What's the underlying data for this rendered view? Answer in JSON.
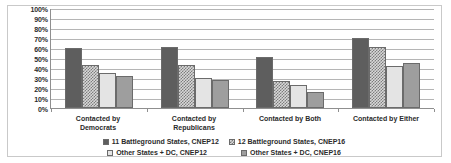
{
  "chart_data": {
    "type": "bar",
    "title": "",
    "subtitle": "",
    "xlabel": "",
    "ylabel": "",
    "ylim": [
      0,
      100
    ],
    "grid": true,
    "legend_position": "bottom",
    "categories": [
      "Contacted by Democrats",
      "Contacted by Republicans",
      "Contacted by Both",
      "Contacted by Either"
    ],
    "category_lines": [
      [
        "Contacted by",
        "Democrats"
      ],
      [
        "Contacted by",
        "Republicans"
      ],
      [
        "Contacted by Both"
      ],
      [
        "Contacted by Either"
      ]
    ],
    "y_ticks": [
      "0%",
      "10%",
      "20%",
      "30%",
      "40%",
      "50%",
      "60%",
      "70%",
      "80%",
      "90%",
      "100%"
    ],
    "y_tick_values": [
      0,
      10,
      20,
      30,
      40,
      50,
      60,
      70,
      80,
      90,
      100
    ],
    "series": [
      {
        "name": "11 Battleground States, CNEP12",
        "pattern": "solid-dark-gray",
        "color": "#5e5e5e",
        "values": [
          60,
          61,
          51,
          70
        ]
      },
      {
        "name": "12 Battleground States, CNEP16",
        "pattern": "checkerboard",
        "color": "#7d7d7d",
        "values": [
          43,
          43,
          27,
          61
        ]
      },
      {
        "name": "Other States + DC, CNEP12",
        "pattern": "light-dotted",
        "color": "#e4e4e4",
        "values": [
          35,
          30,
          23,
          42
        ]
      },
      {
        "name": "Other States + DC, CNEP16",
        "pattern": "solid-medium-gray",
        "color": "#9e9e9e",
        "values": [
          32,
          28,
          16,
          45
        ]
      }
    ]
  },
  "legend": {
    "rows": [
      [
        {
          "label": "11 Battleground States, CNEP12",
          "series": 0
        },
        {
          "label": "12 Battleground States, CNEP16",
          "series": 1
        }
      ],
      [
        {
          "label": "Other States + DC, CNEP12",
          "series": 2
        },
        {
          "label": "Other States + DC, CNEP16",
          "series": 3
        }
      ]
    ]
  }
}
